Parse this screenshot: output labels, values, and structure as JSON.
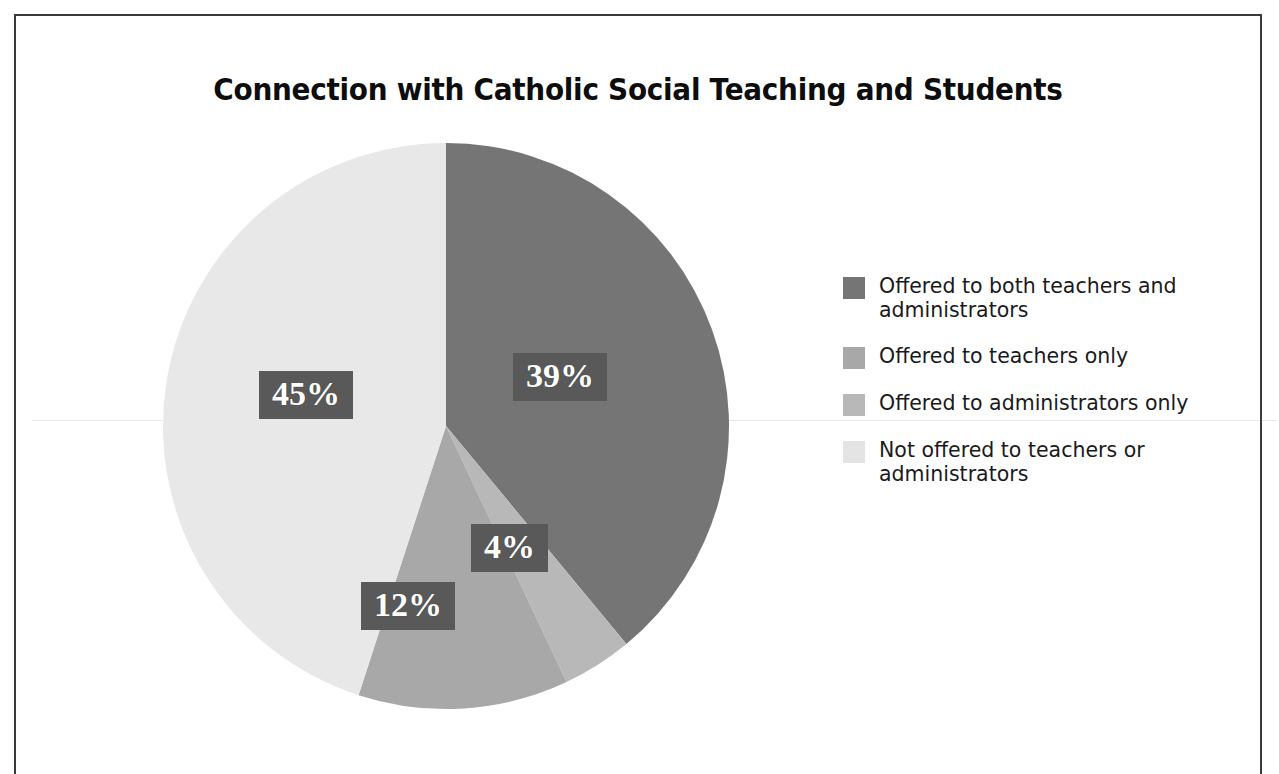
{
  "chart_data": {
    "type": "pie",
    "title": "Connection with Catholic Social Teaching and Students",
    "categories": [
      "Offered to both teachers and administrators",
      "Offered to teachers only",
      "Offered to administrators only",
      "Not offered to teachers or administrators"
    ],
    "values": [
      39,
      12,
      4,
      45
    ],
    "value_labels": [
      "39%",
      "12%",
      "4%",
      "45%"
    ],
    "units": "percent",
    "start_angle_deg": 0,
    "direction": "clockwise",
    "legend_position": "right",
    "grid": false,
    "slice_colors": [
      "#757575",
      "#a8a8a8",
      "#b8b8b8",
      "#e8e8e8"
    ],
    "slices": [
      {
        "label": "Offered to both teachers and administrators",
        "value": 39,
        "display": "39%",
        "color": "#757575"
      },
      {
        "label": "Offered to administrators only",
        "value": 4,
        "display": "4%",
        "color": "#b8b8b8"
      },
      {
        "label": "Offered to teachers only",
        "value": 12,
        "display": "12%",
        "color": "#a8a8a8"
      },
      {
        "label": "Not offered to teachers or administrators",
        "value": 45,
        "display": "45%",
        "color": "#e8e8e8"
      }
    ]
  },
  "title": "Connection with Catholic Social Teaching and Students",
  "labels": {
    "pct_39": "39%",
    "pct_45": "45%",
    "pct_4": "4%",
    "pct_12": "12%"
  },
  "legend": {
    "items": [
      {
        "label": "Offered to both teachers and administrators",
        "color": "#757575"
      },
      {
        "label": "Offered to teachers only",
        "color": "#a8a8a8"
      },
      {
        "label": "Offered to administrators only",
        "color": "#b8b8b8"
      },
      {
        "label": "Not offered to teachers or administrators",
        "color": "#e4e4e4"
      }
    ]
  },
  "colors": {
    "label_box": "#595959",
    "label_text": "#ffffff",
    "title_text": "#0d0d0d",
    "frame_border": "#3a3a3a",
    "background": "#ffffff"
  }
}
